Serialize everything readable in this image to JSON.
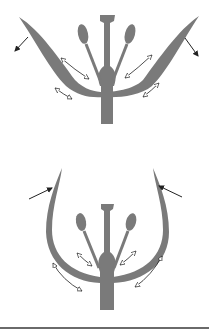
{
  "diagram": {
    "panels": [
      {
        "id": "top",
        "state": "open",
        "outer_arrows": "outward-down",
        "inner_arrows": "double-headed"
      },
      {
        "id": "bottom",
        "state": "closed",
        "outer_arrows": "inward",
        "inner_arrows": "double-headed"
      }
    ],
    "colors": {
      "tissue": "#7a7a7a",
      "arrow": "#222222",
      "background": "#ffffff",
      "rule": "#6a6a6a"
    }
  }
}
